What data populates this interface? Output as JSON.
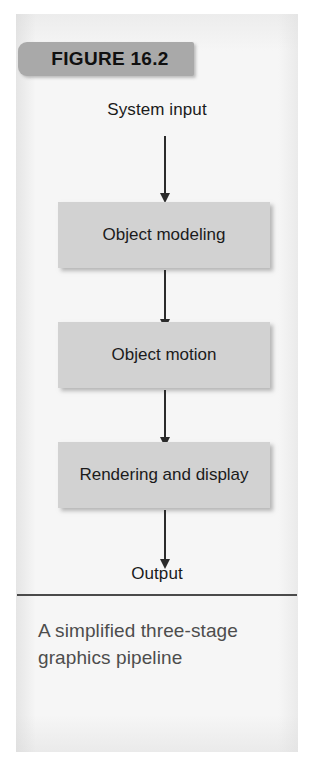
{
  "figure": {
    "banner_label": "FIGURE 16.2",
    "caption": "A simplified three-stage graphics pipeline",
    "colors": {
      "banner_fill": "#a9a9a9",
      "box_fill": "#d2d2d2",
      "panel_background": "#f6f6f6",
      "arrow": "#2b2b2b",
      "caption_text": "#4d4d4d",
      "divider": "#4a4a4a"
    }
  },
  "diagram": {
    "input_label": "System input",
    "output_label": "Output",
    "stages": [
      {
        "label": "Object modeling"
      },
      {
        "label": "Object motion"
      },
      {
        "label": "Rendering and display"
      }
    ],
    "arrows": [
      {
        "name": "input-to-object-modeling"
      },
      {
        "name": "object-modeling-to-object-motion"
      },
      {
        "name": "object-motion-to-rendering"
      },
      {
        "name": "rendering-to-output"
      }
    ]
  }
}
